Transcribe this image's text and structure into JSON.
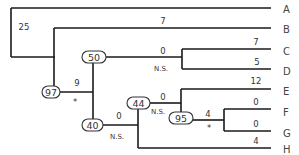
{
  "diagram": {
    "type": "phylogenetic-tree",
    "taxa": [
      "A",
      "B",
      "C",
      "D",
      "E",
      "F",
      "G",
      "H"
    ],
    "branch_labels": {
      "root_to_A_clade": "25",
      "B": "7",
      "clade_CD": "0",
      "clade_CD_sig": "N.S.",
      "C": "7",
      "D": "5",
      "node97_to_node40": "9",
      "node97_to_node40_sig": "*",
      "clade_EFG": "0",
      "clade_EFG_sig": "N.S.",
      "E": "12",
      "clade_FG": "0",
      "clade_FG_sig": "N.S.",
      "clade_FG_length": "4",
      "clade_FG_length_sig": "*",
      "F": "0",
      "G": "0",
      "H": "4"
    },
    "support_nodes": {
      "n97": "97",
      "n50": "50",
      "n40": "40",
      "n44": "44",
      "n95": "95"
    }
  }
}
